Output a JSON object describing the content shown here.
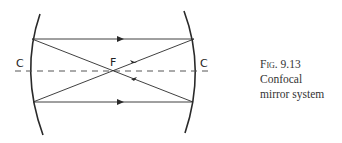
{
  "diagram": {
    "labels": {
      "left_center": "C",
      "right_center": "C",
      "focus": "F"
    },
    "stroke_color": "#2a2a2a",
    "axis_style": "dashed"
  },
  "caption": {
    "fig_label": "Fig. 9.13",
    "line1": "Confocal",
    "line2": "mirror system"
  }
}
